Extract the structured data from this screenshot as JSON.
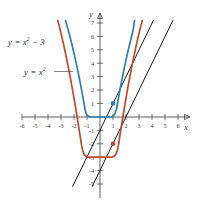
{
  "figure": {
    "title": "",
    "axis_labels": {
      "x": "x",
      "y": "y"
    },
    "curve_labels": {
      "shifted": "y = x² − 3",
      "base": "y = x²"
    }
  },
  "chart_data": {
    "type": "line",
    "title": "",
    "xlabel": "x",
    "ylabel": "y",
    "xlim": [
      -6.8,
      6.8
    ],
    "ylim": [
      -5.6,
      7.6
    ],
    "grid": false,
    "legend": "none",
    "xticks": [
      -6,
      -5,
      -4,
      -3,
      -2,
      -1,
      1,
      2,
      3,
      4,
      5,
      6
    ],
    "xticklabels": [
      "-6",
      "-5",
      "-4",
      "-3",
      "-2",
      "-1",
      "1",
      "2",
      "3",
      "4",
      "5",
      "6"
    ],
    "yticks": [
      -5,
      -4,
      -3,
      -2,
      -1,
      1,
      2,
      3,
      4,
      5,
      6,
      7
    ],
    "yticklabels": [
      "-5",
      "-4",
      "-3",
      "-2",
      "-1",
      "1",
      "2",
      "3",
      "4",
      "5",
      "6",
      "7"
    ],
    "series": [
      {
        "name": "y = x²",
        "equation": "y = x^2",
        "color": "#2f7eb5",
        "type": "parabola",
        "vertex": [
          0,
          0
        ],
        "x_range": [
          -2.65,
          2.65
        ]
      },
      {
        "name": "y = x² − 3",
        "equation": "y = x^2 - 3",
        "color": "#c8462a",
        "type": "parabola",
        "vertex": [
          0,
          -3
        ],
        "x_range": [
          -3.25,
          3.25
        ]
      },
      {
        "name": "tangent to y = x² at (1, 1)",
        "equation": "y = 2x - 1",
        "color": "#1a1a1a",
        "type": "line",
        "x_range": [
          -2.1,
          4.1
        ]
      },
      {
        "name": "tangent to y = x² − 3 at (1, −2)",
        "equation": "y = 2x - 4",
        "color": "#1a1a1a",
        "type": "line",
        "x_range": [
          -0.6,
          5.6
        ]
      }
    ],
    "points": [
      {
        "label": "tangent point on y = x²",
        "x": 1,
        "y": 1,
        "color": "#2f7eb5"
      },
      {
        "label": "tangent point on y = x² − 3",
        "x": 1,
        "y": -2,
        "color": "#c8462a"
      }
    ],
    "annotations": [
      {
        "text": "y = x² − 3",
        "x": -5.6,
        "y": 5.3
      },
      {
        "text": "y = x²",
        "x": -4.4,
        "y": 3.0,
        "leader_to": [
          -2.1,
          2.5
        ]
      }
    ]
  }
}
